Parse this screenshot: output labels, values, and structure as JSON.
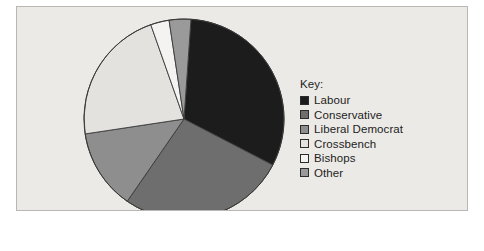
{
  "figure": {
    "background_color": "#eceae6",
    "border_color": "#b9b7b3"
  },
  "legend": {
    "title": "Key:",
    "entries": [
      {
        "label": "Labour",
        "color": "#1c1c1c"
      },
      {
        "label": "Conservative",
        "color": "#6e6e6e"
      },
      {
        "label": "Liberal Democrat",
        "color": "#8e8e8e"
      },
      {
        "label": "Crossbench",
        "color": "#e4e2de"
      },
      {
        "label": "Bishops",
        "color": "#f4f3f1"
      },
      {
        "label": "Other",
        "color": "#9a9a9a"
      }
    ]
  },
  "chart_data": {
    "type": "pie",
    "title": "",
    "categories": [
      "Labour",
      "Conservative",
      "Liberal Democrat",
      "Crossbench",
      "Bishops",
      "Other"
    ],
    "values": [
      31.5,
      27.0,
      13.0,
      22.0,
      3.0,
      3.5
    ],
    "unit": "percent",
    "colors": [
      "#1c1c1c",
      "#6e6e6e",
      "#8e8e8e",
      "#e4e2de",
      "#f4f3f1",
      "#9a9a9a"
    ],
    "start_angle_deg": 4,
    "direction": "clockwise",
    "legend_position": "right",
    "grid": false,
    "labels_shown": false,
    "geometry": {
      "center_x": 167,
      "center_y": 112,
      "radius": 100
    }
  }
}
